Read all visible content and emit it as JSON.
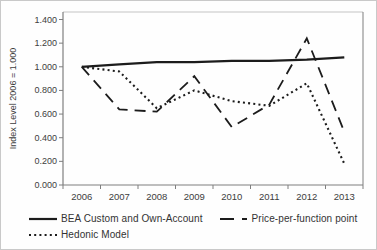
{
  "chart_data": {
    "type": "line",
    "title": "",
    "xlabel": "",
    "ylabel": "Index Level 2006 = 1.000",
    "categories": [
      "2006",
      "2007",
      "2008",
      "2009",
      "2010",
      "2011",
      "2012",
      "2013"
    ],
    "series": [
      {
        "name": "BEA Custom and Own-Account",
        "style": "solid",
        "values": [
          1.0,
          1.02,
          1.04,
          1.04,
          1.05,
          1.05,
          1.06,
          1.08
        ]
      },
      {
        "name": "Price-per-function point",
        "style": "dashed",
        "values": [
          1.0,
          0.64,
          0.62,
          0.92,
          0.49,
          0.68,
          1.24,
          0.45
        ]
      },
      {
        "name": "Hedonic Model",
        "style": "dotted",
        "values": [
          1.0,
          0.96,
          0.65,
          0.8,
          0.71,
          0.67,
          0.86,
          0.18
        ]
      }
    ],
    "ylim": [
      0.0,
      1.4
    ],
    "ytick_step": 0.2,
    "ytick_labels": [
      "0.000",
      "0.200",
      "0.400",
      "0.600",
      "0.800",
      "1.000",
      "1.200",
      "1.400"
    ],
    "grid": false,
    "legend_position": "bottom-left",
    "colors": {
      "line": "#1c1c1c",
      "axis": "#7f7f7f",
      "box_top": "#c4c4c4",
      "tick_text": "#3d3d3d"
    }
  }
}
